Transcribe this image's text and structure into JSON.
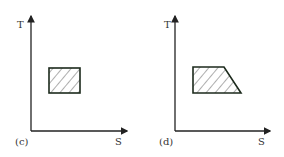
{
  "panels": [
    {
      "id": "c",
      "caption": "(c)",
      "y_axis_label": "T",
      "x_axis_label": "S",
      "shape": "rectangle",
      "fill": "hatched"
    },
    {
      "id": "d",
      "caption": "(d)",
      "y_axis_label": "T",
      "x_axis_label": "S",
      "shape": "trapezoid",
      "fill": "hatched"
    }
  ],
  "colors": {
    "axis": "#222222",
    "outline": "#1c2a1c",
    "hatch": "#333333",
    "background": "#ffffff"
  }
}
